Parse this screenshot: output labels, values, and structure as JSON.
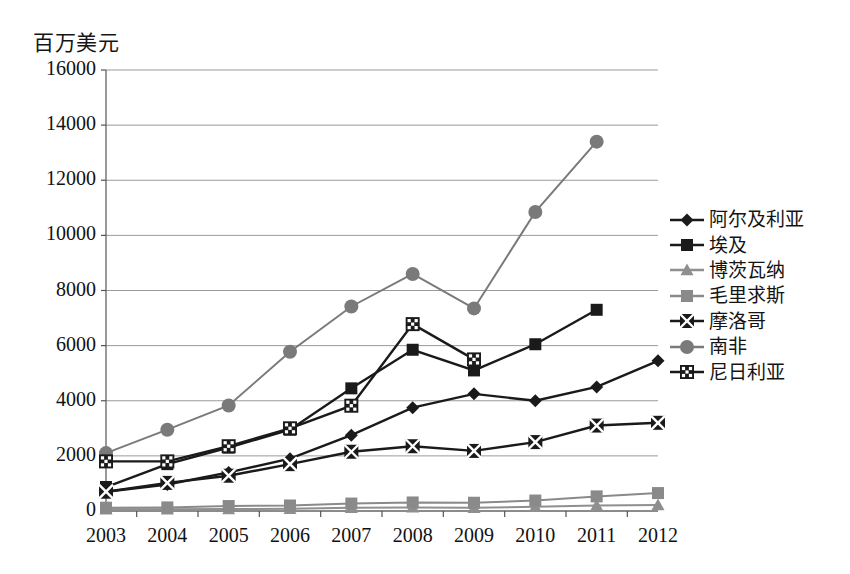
{
  "chart_data": {
    "type": "line",
    "title": "百万美元",
    "xlabel": "",
    "ylabel": "百万美元",
    "x": [
      2003,
      2004,
      2005,
      2006,
      2007,
      2008,
      2009,
      2010,
      2011,
      2012
    ],
    "categories": [
      "2003",
      "2004",
      "2005",
      "2006",
      "2007",
      "2008",
      "2009",
      "2010",
      "2011",
      "2012"
    ],
    "ylim": [
      0,
      16000
    ],
    "yticks": [
      0,
      2000,
      4000,
      6000,
      8000,
      10000,
      12000,
      14000,
      16000
    ],
    "ytick_labels": [
      "0",
      "2000",
      "4000",
      "6000",
      "8000",
      "10000",
      "12000",
      "14000",
      "16000"
    ],
    "grid": true,
    "legend_position": "right",
    "series": [
      {
        "name": "阿尔及利亚",
        "marker": "diamond",
        "color": "#1a1a1a",
        "x": [
          2003,
          2004,
          2005,
          2006,
          2007,
          2008,
          2009,
          2010,
          2011,
          2012
        ],
        "values": [
          700,
          960,
          1400,
          1900,
          2750,
          3750,
          4250,
          4000,
          4500,
          5450
        ]
      },
      {
        "name": "埃及",
        "marker": "square",
        "color": "#1a1a1a",
        "x": [
          2003,
          2004,
          2005,
          2006,
          2007,
          2008,
          2009,
          2010,
          2011
        ],
        "values": [
          870,
          1700,
          2300,
          2950,
          4450,
          5850,
          5100,
          6050,
          7300
        ]
      },
      {
        "name": "博茨瓦纳",
        "marker": "triangle",
        "color": "#8f8f8f",
        "x": [
          2003,
          2004,
          2005,
          2006,
          2007,
          2008,
          2009,
          2010,
          2011,
          2012
        ],
        "values": [
          60,
          60,
          70,
          80,
          120,
          130,
          120,
          150,
          200,
          220
        ]
      },
      {
        "name": "毛里求斯",
        "marker": "square-gray",
        "color": "#8a8a8a",
        "x": [
          2003,
          2004,
          2005,
          2006,
          2007,
          2008,
          2009,
          2010,
          2011,
          2012
        ],
        "values": [
          120,
          130,
          180,
          200,
          270,
          310,
          300,
          380,
          530,
          650
        ]
      },
      {
        "name": "摩洛哥",
        "marker": "x-square",
        "color": "#1a1a1a",
        "x": [
          2003,
          2004,
          2005,
          2006,
          2007,
          2008,
          2009,
          2010,
          2011,
          2012
        ],
        "values": [
          700,
          1020,
          1280,
          1700,
          2150,
          2350,
          2180,
          2500,
          3100,
          3200
        ]
      },
      {
        "name": "南非",
        "marker": "circle",
        "color": "#7a7a7a",
        "x": [
          2003,
          2004,
          2005,
          2006,
          2007,
          2008,
          2009,
          2010,
          2011
        ],
        "values": [
          2100,
          2950,
          3830,
          5780,
          7420,
          8600,
          7350,
          10850,
          13400
        ]
      },
      {
        "name": "尼日利亚",
        "marker": "hatched-square",
        "color": "#1a1a1a",
        "x": [
          2003,
          2004,
          2005,
          2006,
          2007,
          2008,
          2009
        ],
        "values": [
          1800,
          1800,
          2350,
          3000,
          3820,
          6780,
          5500
        ]
      }
    ]
  }
}
